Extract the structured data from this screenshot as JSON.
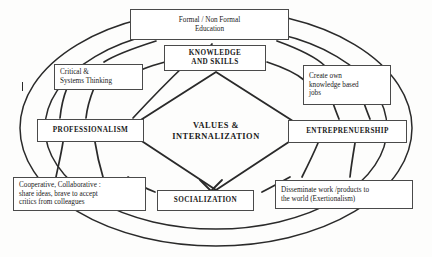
{
  "diagram": {
    "title_center": "VALUES &\nINTERNALIZATION",
    "nodes": {
      "education": {
        "label": "Formal / Non Formal\nEducation"
      },
      "knowledge": {
        "label": "KNOWLEDGE\nAND SKILLS"
      },
      "critical": {
        "label": "Critical &\nSystems Thinking"
      },
      "create_jobs": {
        "label": "Create own\nknowledge based\njobs"
      },
      "professionalism": {
        "label": "PROFESSIONALISM"
      },
      "entrepreneurship": {
        "label": "ENTREPRENUERSHIP"
      },
      "socialization": {
        "label": "SOCIALIZATION"
      },
      "cooperative": {
        "label": "Cooperative, Collaborative :\nshare ideas, brave to accept\ncritics from colleagues"
      },
      "disseminate": {
        "label": "Disseminate work /products to\nthe world (Exertionalism)"
      }
    },
    "colors": {
      "stroke": "#2a2a2a",
      "box_border": "#4a4a4a",
      "text": "#1a1a1a",
      "background": "#fdfdfc"
    }
  }
}
